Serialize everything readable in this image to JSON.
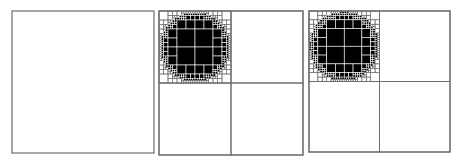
{
  "figure": {
    "width": 459,
    "height": 164,
    "background": "#ffffff",
    "stroke_color": "#6e6e6e",
    "fill_color": "#000000",
    "cell_line_color": "#ffffff",
    "panels": [
      {
        "id": "panel-1",
        "label": "root-node-empty",
        "x": 12,
        "y": 11,
        "size": 142,
        "subdivided": false,
        "circle": null
      },
      {
        "id": "panel-2",
        "label": "quadtree-level-decomposition",
        "x": 159,
        "y": 11,
        "size": 144,
        "subdivided": true,
        "circle": {
          "cx": 195,
          "cy": 47,
          "r": 33,
          "max_depth": 5
        }
      },
      {
        "id": "panel-3",
        "label": "quadtree-refined-decomposition",
        "x": 309,
        "y": 11,
        "size": 141,
        "subdivided": true,
        "circle": {
          "cx": 344,
          "cy": 46,
          "r": 33,
          "max_depth": 5
        }
      }
    ]
  }
}
